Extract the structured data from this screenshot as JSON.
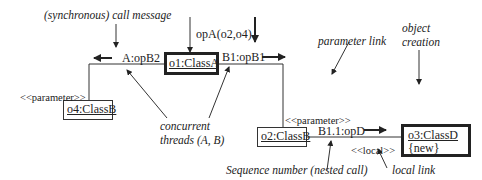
{
  "diagram": {
    "type": "UML communication diagram",
    "objects": [
      {
        "id": "o1",
        "label": "o1:ClassA",
        "extra": ""
      },
      {
        "id": "o2",
        "label": "o2:ClassB",
        "extra": ""
      },
      {
        "id": "o3",
        "label": "o3:ClassD",
        "extra": "{new}"
      },
      {
        "id": "o4",
        "label": "o4:ClassB",
        "extra": ""
      }
    ],
    "messages": {
      "incoming": "opA(o2,o4)",
      "a_opb2": "A:opB2",
      "b1_opb1": "B1:opB1",
      "b11_opd": "B1.1:opD"
    },
    "stereotypes": {
      "param_left": "<<parameter>>",
      "param_right": "<<parameter>>",
      "local": "<<local>>"
    },
    "annotations": {
      "sync_call": "(synchronous) call message",
      "parameter_link": "parameter link",
      "object_creation_1": "object",
      "object_creation_2": "creation",
      "concurrent_1": "concurrent",
      "concurrent_2": "threads (A, B)",
      "sequence_number": "Sequence number (nested call)",
      "local_link": "local link"
    }
  }
}
